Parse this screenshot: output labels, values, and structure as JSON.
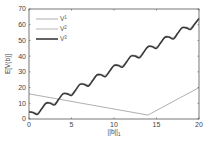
{
  "chart_data": {
    "type": "line",
    "title": "",
    "xlabel": "||b||_1",
    "ylabel": "E[V(b)]",
    "xlim": [
      0,
      20
    ],
    "ylim": [
      0,
      70
    ],
    "xticks": [
      0,
      5,
      10,
      15,
      20
    ],
    "yticks": [
      0,
      10,
      20,
      30,
      40,
      50,
      60,
      70
    ],
    "grid": false,
    "legend_position": "upper left",
    "series": [
      {
        "name": "V^1",
        "label_base": "V",
        "label_sup": "1",
        "color": "#9a9a9a",
        "width": 0.8,
        "x": [
          0,
          14,
          20
        ],
        "y": [
          16,
          2.5,
          20
        ]
      },
      {
        "name": "V^2",
        "label_base": "V",
        "label_sup": "2",
        "color": "#b5b5b5",
        "width": 1.0,
        "x": [
          0,
          0.5,
          1,
          1.5,
          2,
          2.5,
          3,
          3.5,
          4,
          4.5,
          5,
          5.5,
          6,
          6.5,
          7,
          7.5,
          8,
          8.5,
          9,
          9.5,
          10,
          10.5,
          11,
          11.5,
          12,
          12.5,
          13,
          13.5,
          14,
          14.5,
          15,
          15.5,
          16,
          16.5,
          17,
          17.5,
          18,
          18.5,
          19,
          19.5,
          20
        ],
        "y": [
          5,
          4.5,
          3.8,
          7,
          10.5,
          10.5,
          10,
          13,
          16.5,
          16.5,
          16,
          19,
          22.5,
          22.5,
          22,
          25,
          28.5,
          28.5,
          28,
          31,
          34.5,
          34.5,
          34,
          37,
          40.5,
          40.5,
          40,
          43,
          46.5,
          46.5,
          46,
          49,
          52.5,
          52.5,
          52,
          55,
          58.5,
          58.5,
          58,
          61,
          64.5
        ]
      },
      {
        "name": "V^3",
        "label_base": "V",
        "label_sup": "3",
        "color": "#3a3a3a",
        "width": 1.6,
        "x": [
          0,
          0.5,
          1,
          1.5,
          2,
          2.5,
          3,
          3.5,
          4,
          4.5,
          5,
          5.5,
          6,
          6.5,
          7,
          7.5,
          8,
          8.5,
          9,
          9.5,
          10,
          10.5,
          11,
          11.5,
          12,
          12.5,
          13,
          13.5,
          14,
          14.5,
          15,
          15.5,
          16,
          16.5,
          17,
          17.5,
          18,
          18.5,
          19,
          19.5,
          20
        ],
        "y": [
          4.5,
          4,
          3,
          6.5,
          10,
          10,
          9,
          12.5,
          16,
          16,
          15,
          18.5,
          22,
          22,
          21,
          24.5,
          28,
          28,
          27,
          30.5,
          34,
          34,
          33,
          36.5,
          40,
          40,
          39,
          42.5,
          46,
          46,
          45,
          48.5,
          52,
          52,
          51,
          54.5,
          58,
          58,
          57,
          60.5,
          64
        ]
      }
    ]
  },
  "layout": {
    "plot": {
      "left": 29,
      "top": 9,
      "right": 199,
      "bottom": 119
    }
  }
}
